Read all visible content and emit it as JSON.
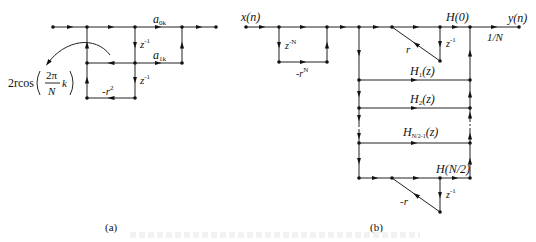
{
  "panel_a": {
    "sublabel": "(a)",
    "branch_gains": {
      "a_top": "a",
      "a_top_sub": "0k",
      "a_mid": "a",
      "a_mid_sub": "1k",
      "delay1": "z",
      "delay1_sup": "-1",
      "delay2": "z",
      "delay2_sup": "-1",
      "feedback": "-r",
      "feedback_sup": "2"
    },
    "coef_label": {
      "prefix": "2rcos",
      "numerator": "2π",
      "denominator": "N",
      "suffix": "k"
    }
  },
  "panel_b": {
    "sublabel": "(b)",
    "input": "x(n)",
    "output": "y(n)",
    "output_gain": "1/N",
    "comb_delay": "z",
    "comb_delay_sup": "-N",
    "comb_gain": "-r",
    "comb_gain_sup": "N",
    "branches": [
      {
        "label": "H(0)"
      },
      {
        "label": "H",
        "sub": "1",
        "suffix": "(z)"
      },
      {
        "label": "H",
        "sub": "2",
        "suffix": "(z)"
      },
      {
        "label": "H",
        "sub": "N/2-1",
        "suffix": "(z)"
      },
      {
        "label": "H(N/2)"
      }
    ],
    "h0_feedback": "r",
    "h0_delay": "z",
    "h0_delay_sup": "-1",
    "hn2_feedback": "-r",
    "hn2_delay": "z",
    "hn2_delay_sup": "-1"
  },
  "caption": ""
}
